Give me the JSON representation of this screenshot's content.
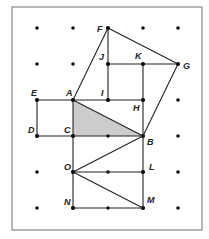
{
  "diagram": {
    "frame": {
      "x": 12,
      "y": 7,
      "width": 190,
      "height": 223,
      "stroke": "#888888"
    },
    "colors": {
      "line": "#222222",
      "dot": "#111111",
      "shade": "#cccccc"
    },
    "grid": {
      "xs": [
        37,
        73,
        108,
        143,
        178
      ],
      "ys": [
        28,
        64,
        100,
        136,
        172,
        208
      ]
    },
    "points": {
      "F": {
        "x": 108,
        "y": 28,
        "lx": 97,
        "ly": 32
      },
      "G": {
        "x": 178,
        "y": 64,
        "lx": 183,
        "ly": 69
      },
      "J": {
        "x": 108,
        "y": 64,
        "lx": 99,
        "ly": 60
      },
      "K": {
        "x": 143,
        "y": 64,
        "lx": 135,
        "ly": 59
      },
      "E": {
        "x": 37,
        "y": 100,
        "lx": 31,
        "ly": 96
      },
      "A": {
        "x": 73,
        "y": 100,
        "lx": 66,
        "ly": 96
      },
      "I": {
        "x": 108,
        "y": 100,
        "lx": 101,
        "ly": 96
      },
      "H": {
        "x": 143,
        "y": 100,
        "lx": 133,
        "ly": 111
      },
      "D": {
        "x": 37,
        "y": 136,
        "lx": 28,
        "ly": 133
      },
      "C": {
        "x": 73,
        "y": 136,
        "lx": 64,
        "ly": 133
      },
      "B": {
        "x": 143,
        "y": 136,
        "lx": 147,
        "ly": 145
      },
      "O": {
        "x": 73,
        "y": 172,
        "lx": 64,
        "ly": 170
      },
      "L": {
        "x": 143,
        "y": 172,
        "lx": 149,
        "ly": 170
      },
      "N": {
        "x": 73,
        "y": 208,
        "lx": 64,
        "ly": 205
      },
      "M": {
        "x": 143,
        "y": 208,
        "lx": 147,
        "ly": 203
      }
    },
    "labels": [
      "F",
      "G",
      "J",
      "K",
      "E",
      "A",
      "I",
      "H",
      "D",
      "C",
      "B",
      "O",
      "L",
      "N",
      "M"
    ],
    "shaded_triangle": [
      "A",
      "C",
      "B"
    ],
    "segments": [
      [
        "A",
        "F"
      ],
      [
        "F",
        "G"
      ],
      [
        "G",
        "B"
      ],
      [
        "F",
        "I"
      ],
      [
        "J",
        "G"
      ],
      [
        "K",
        "H"
      ],
      [
        "A",
        "H"
      ],
      [
        "E",
        "A"
      ],
      [
        "E",
        "D"
      ],
      [
        "D",
        "B"
      ],
      [
        "A",
        "N"
      ],
      [
        "H",
        "M"
      ],
      [
        "A",
        "B"
      ],
      [
        "O",
        "B"
      ],
      [
        "O",
        "L"
      ],
      [
        "O",
        "M"
      ],
      [
        "N",
        "M"
      ]
    ]
  }
}
